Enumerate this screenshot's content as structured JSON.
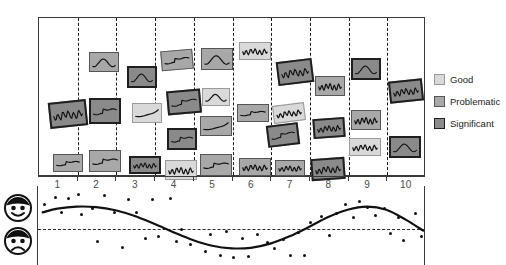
{
  "chart_title": "",
  "legend": {
    "position": "right",
    "items": [
      {
        "label": "Good",
        "color": "#d9d9d9",
        "border": "#9a9a9a",
        "key": "good"
      },
      {
        "label": "Problematic",
        "color": "#a8a8a8",
        "border": "#555555",
        "key": "problematic"
      },
      {
        "label": "Significant",
        "color": "#8a8a8a",
        "border": "#1f1f1f",
        "key": "significant"
      }
    ]
  },
  "axis": {
    "tick_labels": [
      "1",
      "2",
      "3",
      "4",
      "5",
      "6",
      "7",
      "8",
      "9",
      "10"
    ],
    "label_left_top": "happy-face",
    "label_left_bottom": "sad-face"
  },
  "chart_data": {
    "type": "scatter",
    "title": "",
    "xlabel": "",
    "ylabel": "",
    "xlim": [
      0.5,
      10.5
    ],
    "ylim": [
      -1.4,
      1.4
    ],
    "grid": false,
    "legend_position": "right",
    "categories": [
      "1",
      "2",
      "3",
      "4",
      "5",
      "6",
      "7",
      "8",
      "9",
      "10"
    ],
    "series": [
      {
        "name": "Sentiment trend",
        "type": "line",
        "x": [
          0.62,
          1.0,
          1.5,
          2.0,
          2.5,
          3.0,
          3.5,
          4.0,
          4.5,
          5.0,
          5.5,
          6.0,
          6.5,
          7.0,
          7.5,
          8.0,
          8.5,
          9.0,
          9.5,
          10.0,
          10.45
        ],
        "y": [
          0.62,
          0.76,
          0.84,
          0.82,
          0.7,
          0.48,
          0.18,
          -0.14,
          -0.44,
          -0.66,
          -0.76,
          -0.74,
          -0.58,
          -0.3,
          0.06,
          0.44,
          0.72,
          0.84,
          0.72,
          0.34,
          -0.08
        ]
      },
      {
        "name": "Observations",
        "type": "scatter",
        "points": [
          [
            0.66,
            0.92
          ],
          [
            0.95,
            1.18
          ],
          [
            1.12,
            0.62
          ],
          [
            1.3,
            1.16
          ],
          [
            1.55,
            1.3
          ],
          [
            1.62,
            0.52
          ],
          [
            1.92,
            0.75
          ],
          [
            2.05,
            -0.5
          ],
          [
            2.22,
            1.28
          ],
          [
            2.48,
            0.6
          ],
          [
            2.68,
            -0.72
          ],
          [
            2.85,
            1.1
          ],
          [
            3.05,
            0.62
          ],
          [
            3.28,
            -0.38
          ],
          [
            3.45,
            1.12
          ],
          [
            3.62,
            -0.3
          ],
          [
            3.92,
            1.14
          ],
          [
            4.08,
            -0.5
          ],
          [
            4.22,
            -0.02
          ],
          [
            4.45,
            -0.62
          ],
          [
            4.82,
            -0.88
          ],
          [
            4.95,
            -0.22
          ],
          [
            5.22,
            -1.02
          ],
          [
            5.38,
            -0.12
          ],
          [
            5.55,
            -1.1
          ],
          [
            5.78,
            -0.4
          ],
          [
            5.95,
            -1.08
          ],
          [
            6.18,
            -0.22
          ],
          [
            6.42,
            -0.52
          ],
          [
            6.62,
            -0.78
          ],
          [
            6.85,
            -0.42
          ],
          [
            7.02,
            -1.05
          ],
          [
            7.22,
            -0.14
          ],
          [
            7.38,
            -1.02
          ],
          [
            7.55,
            0.22
          ],
          [
            7.82,
            0.46
          ],
          [
            8.02,
            -0.28
          ],
          [
            8.22,
            0.58
          ],
          [
            8.45,
            0.92
          ],
          [
            8.65,
            0.44
          ],
          [
            8.82,
            1.04
          ],
          [
            9.02,
            0.82
          ],
          [
            9.22,
            0.5
          ],
          [
            9.45,
            0.76
          ],
          [
            9.62,
            -0.18
          ],
          [
            9.82,
            0.42
          ],
          [
            9.95,
            -0.46
          ],
          [
            10.25,
            0.56
          ],
          [
            10.42,
            -0.3
          ]
        ]
      }
    ],
    "reference_line": {
      "y": 0.0,
      "style": "dashed"
    },
    "cards": [
      {
        "bin": 1,
        "x": 10,
        "y": 83,
        "w": 38,
        "h": 26,
        "rot": -6,
        "kind": "significant",
        "spark": "noisy"
      },
      {
        "bin": 1,
        "x": 14,
        "y": 136,
        "w": 30,
        "h": 18,
        "rot": 0,
        "kind": "problematic",
        "spark": "step"
      },
      {
        "bin": 2,
        "x": 50,
        "y": 34,
        "w": 30,
        "h": 20,
        "rot": 0,
        "kind": "problematic",
        "spark": "wiggle"
      },
      {
        "bin": 2,
        "x": 50,
        "y": 80,
        "w": 32,
        "h": 26,
        "rot": 0,
        "kind": "significant",
        "spark": "step"
      },
      {
        "bin": 2,
        "x": 50,
        "y": 132,
        "w": 32,
        "h": 22,
        "rot": 0,
        "kind": "problematic",
        "spark": "step"
      },
      {
        "bin": 3,
        "x": 88,
        "y": 48,
        "w": 30,
        "h": 22,
        "rot": 0,
        "kind": "significant",
        "spark": "wiggle"
      },
      {
        "bin": 3,
        "x": 93,
        "y": 85,
        "w": 30,
        "h": 20,
        "rot": 0,
        "kind": "good",
        "spark": "rise"
      },
      {
        "bin": 3,
        "x": 90,
        "y": 138,
        "w": 32,
        "h": 18,
        "rot": 0,
        "kind": "significant",
        "spark": "noisy"
      },
      {
        "bin": 4,
        "x": 122,
        "y": 32,
        "w": 32,
        "h": 20,
        "rot": -5,
        "kind": "problematic",
        "spark": "step"
      },
      {
        "bin": 4,
        "x": 128,
        "y": 72,
        "w": 34,
        "h": 24,
        "rot": -5,
        "kind": "significant",
        "spark": "step"
      },
      {
        "bin": 4,
        "x": 128,
        "y": 110,
        "w": 30,
        "h": 22,
        "rot": 0,
        "kind": "significant",
        "spark": "step"
      },
      {
        "bin": 4,
        "x": 126,
        "y": 142,
        "w": 32,
        "h": 20,
        "rot": 0,
        "kind": "good",
        "spark": "noisy"
      },
      {
        "bin": 5,
        "x": 162,
        "y": 30,
        "w": 32,
        "h": 22,
        "rot": 0,
        "kind": "problematic",
        "spark": "wiggle"
      },
      {
        "bin": 5,
        "x": 163,
        "y": 70,
        "w": 28,
        "h": 18,
        "rot": 0,
        "kind": "good",
        "spark": "wiggle"
      },
      {
        "bin": 5,
        "x": 161,
        "y": 98,
        "w": 32,
        "h": 20,
        "rot": 0,
        "kind": "problematic",
        "spark": "rise"
      },
      {
        "bin": 5,
        "x": 161,
        "y": 136,
        "w": 32,
        "h": 22,
        "rot": 0,
        "kind": "problematic",
        "spark": "step"
      },
      {
        "bin": 6,
        "x": 200,
        "y": 24,
        "w": 32,
        "h": 18,
        "rot": 0,
        "kind": "good",
        "spark": "noisy"
      },
      {
        "bin": 6,
        "x": 198,
        "y": 86,
        "w": 32,
        "h": 18,
        "rot": 0,
        "kind": "problematic",
        "spark": "step"
      },
      {
        "bin": 6,
        "x": 200,
        "y": 140,
        "w": 32,
        "h": 18,
        "rot": 0,
        "kind": "problematic",
        "spark": "noisy"
      },
      {
        "bin": 7,
        "x": 238,
        "y": 42,
        "w": 36,
        "h": 24,
        "rot": -7,
        "kind": "significant",
        "spark": "noisy"
      },
      {
        "bin": 7,
        "x": 234,
        "y": 86,
        "w": 32,
        "h": 18,
        "rot": -7,
        "kind": "good",
        "spark": "noisy"
      },
      {
        "bin": 7,
        "x": 228,
        "y": 106,
        "w": 32,
        "h": 22,
        "rot": -7,
        "kind": "significant",
        "spark": "step"
      },
      {
        "bin": 7,
        "x": 236,
        "y": 142,
        "w": 30,
        "h": 16,
        "rot": 0,
        "kind": "problematic",
        "spark": "noisy"
      },
      {
        "bin": 8,
        "x": 276,
        "y": 58,
        "w": 30,
        "h": 20,
        "rot": 0,
        "kind": "problematic",
        "spark": "noisy"
      },
      {
        "bin": 8,
        "x": 274,
        "y": 100,
        "w": 32,
        "h": 20,
        "rot": -4,
        "kind": "significant",
        "spark": "noisy"
      },
      {
        "bin": 8,
        "x": 272,
        "y": 140,
        "w": 34,
        "h": 22,
        "rot": -4,
        "kind": "significant",
        "spark": "noisy"
      },
      {
        "bin": 9,
        "x": 312,
        "y": 40,
        "w": 30,
        "h": 22,
        "rot": 0,
        "kind": "significant",
        "spark": "wiggle"
      },
      {
        "bin": 9,
        "x": 312,
        "y": 92,
        "w": 30,
        "h": 20,
        "rot": 0,
        "kind": "problematic",
        "spark": "noisy"
      },
      {
        "bin": 9,
        "x": 310,
        "y": 120,
        "w": 32,
        "h": 18,
        "rot": 0,
        "kind": "good",
        "spark": "noisy"
      },
      {
        "bin": 10,
        "x": 350,
        "y": 62,
        "w": 34,
        "h": 22,
        "rot": -6,
        "kind": "significant",
        "spark": "noisy"
      },
      {
        "bin": 10,
        "x": 350,
        "y": 118,
        "w": 32,
        "h": 22,
        "rot": 0,
        "kind": "significant",
        "spark": "wiggle"
      }
    ]
  }
}
